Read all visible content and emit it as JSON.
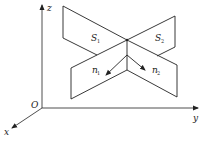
{
  "figure": {
    "colors": {
      "stroke": "#222222",
      "background": "#ffffff"
    },
    "axes": {
      "x_label": "x",
      "y_label": "y",
      "z_label": "z",
      "origin_label": "O"
    },
    "planes": [
      {
        "name": "S",
        "subscript": "1"
      },
      {
        "name": "S",
        "subscript": "2"
      }
    ],
    "normals": [
      {
        "name": "n",
        "subscript": "1"
      },
      {
        "name": "n",
        "subscript": "2"
      }
    ]
  }
}
